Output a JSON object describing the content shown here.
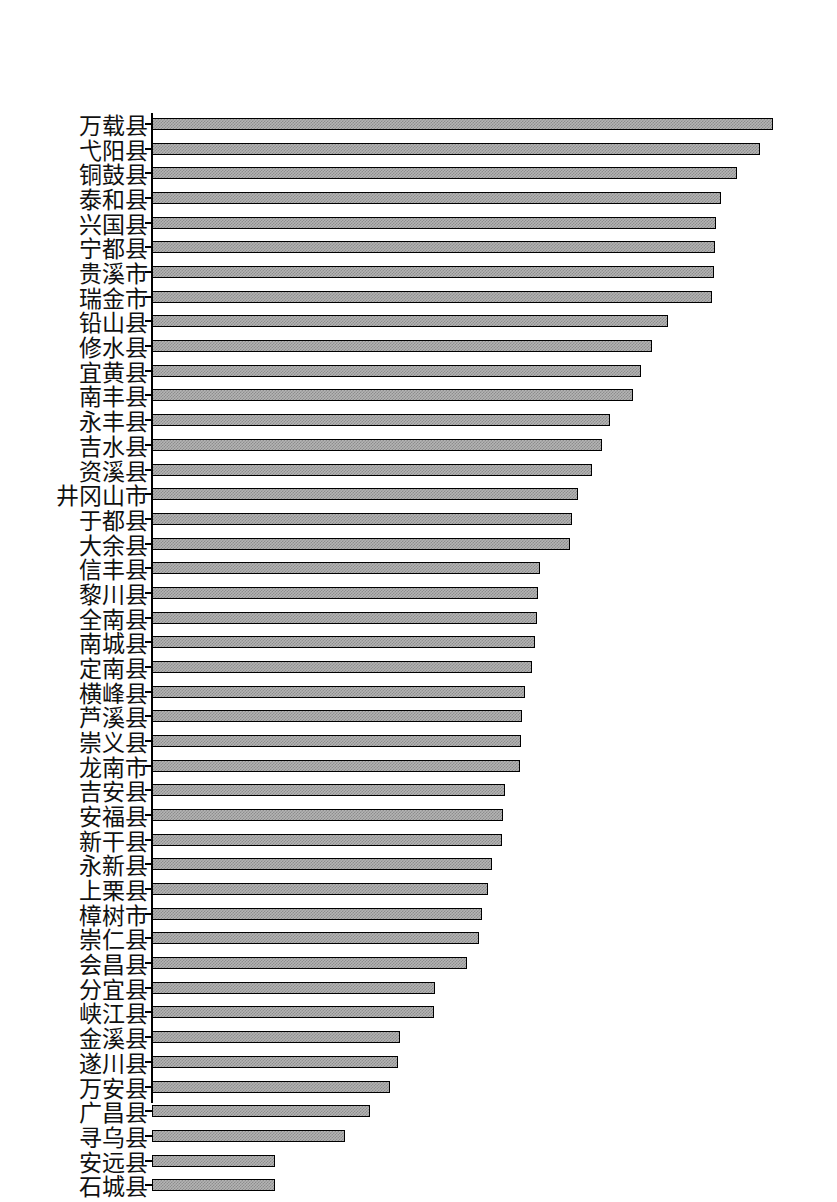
{
  "chart_data": {
    "type": "bar",
    "orientation": "horizontal",
    "title": "",
    "subtitle": "",
    "xlabel": "",
    "ylabel": "",
    "grid": false,
    "legend": null,
    "axis": {
      "category_axis": "y",
      "value_axis": "x",
      "value_axis_visible": false,
      "tick_marks": true,
      "xlim": [
        0,
        100
      ]
    },
    "note": "Bar lengths read off pixel extents, normalized so the longest bar = 100.",
    "categories": [
      "万载县",
      "弋阳县",
      "铜鼓县",
      "泰和县",
      "兴国县",
      "宁都县",
      "贵溪市",
      "瑞金市",
      "铅山县",
      "修水县",
      "宜黄县",
      "南丰县",
      "永丰县",
      "吉水县",
      "资溪县",
      "井冈山市",
      "于都县",
      "大余县",
      "信丰县",
      "黎川县",
      "全南县",
      "南城县",
      "定南县",
      "横峰县",
      "芦溪县",
      "崇义县",
      "龙南市",
      "吉安县",
      "安福县",
      "新干县",
      "永新县",
      "上栗县",
      "樟树市",
      "崇仁县",
      "会昌县",
      "分宜县",
      "峡江县",
      "金溪县",
      "遂川县",
      "万安县",
      "广昌县",
      "寻乌县",
      "安远县",
      "石城县"
    ],
    "values": [
      100.0,
      97.9,
      94.2,
      91.6,
      90.9,
      90.6,
      90.5,
      90.2,
      83.1,
      80.5,
      78.7,
      77.5,
      73.8,
      72.5,
      70.9,
      68.6,
      67.6,
      67.3,
      62.5,
      62.2,
      62.0,
      61.7,
      61.2,
      60.1,
      59.6,
      59.4,
      59.3,
      56.8,
      56.5,
      56.4,
      54.8,
      54.1,
      53.1,
      52.7,
      50.7,
      45.6,
      45.4,
      39.9,
      39.6,
      38.3,
      35.1,
      31.1,
      19.8,
      19.8
    ],
    "bar_end_px": [
      773,
      760,
      737,
      721,
      717,
      715,
      714,
      712,
      668,
      652,
      641,
      633,
      610,
      602,
      592,
      578,
      572,
      570,
      540,
      538,
      537,
      535,
      532,
      525,
      522,
      521,
      520,
      505,
      503,
      502,
      492,
      488,
      482,
      479,
      467,
      435,
      434,
      400,
      398,
      390,
      370,
      345,
      275,
      275
    ],
    "colors": {
      "bar_fill": "#b4b4b4",
      "bar_pattern": "#8d8d8d",
      "bar_border": "#000000",
      "axis": "#000000",
      "background": "#ffffff",
      "label_text": "#111111"
    }
  }
}
